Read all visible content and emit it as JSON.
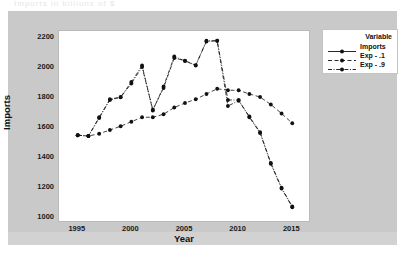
{
  "top_fragment": "Imports in billions of $",
  "legend": {
    "title": "Variable",
    "entries": [
      {
        "label": "Imports",
        "style": "solid",
        "color": "#111111"
      },
      {
        "label": "Exp - .1",
        "style": "dashed",
        "color": "#111111"
      },
      {
        "label": "Exp - .9",
        "style": "dashdot",
        "color": "#111111"
      }
    ]
  },
  "chart_data": {
    "type": "line",
    "title": "",
    "xlabel": "Year",
    "ylabel": "Imports",
    "xlim": [
      1994,
      2016
    ],
    "ylim": [
      1000,
      2200
    ],
    "xticks": [
      1995,
      2000,
      2005,
      2010,
      2015
    ],
    "yticks": [
      1000,
      1200,
      1400,
      1600,
      1800,
      2000,
      2200
    ],
    "grid": false,
    "legend_position": "right-outside",
    "marker": "filled-circle",
    "x": [
      1995,
      1996,
      1997,
      1998,
      1999,
      2000,
      2001,
      2002,
      2003,
      2004,
      2005,
      2006,
      2007,
      2008,
      2009,
      2010,
      2011,
      2012,
      2013,
      2014,
      2015
    ],
    "series": [
      {
        "name": "Imports",
        "style": "dashdot",
        "values": [
          1545,
          1540,
          1665,
          1785,
          1800,
          1900,
          2010,
          1710,
          1870,
          2070,
          2040,
          2010,
          2175,
          2175,
          1780,
          1780,
          1665,
          1560,
          1355,
          1190,
          1065
        ]
      },
      {
        "name": "Exp - .1",
        "style": "dashed",
        "values": [
          1545,
          1540,
          1555,
          1580,
          1605,
          1635,
          1665,
          1665,
          1685,
          1730,
          1760,
          1785,
          1820,
          1855,
          1845,
          1845,
          1820,
          1800,
          1750,
          1690,
          1625
        ]
      },
      {
        "name": "Exp - .9",
        "style": "dashdot",
        "values": [
          1545,
          1540,
          1660,
          1780,
          1798,
          1890,
          2000,
          1715,
          1860,
          2060,
          2042,
          2013,
          2170,
          2175,
          1740,
          1775,
          1670,
          1565,
          1360,
          1195,
          1070
        ]
      }
    ]
  }
}
